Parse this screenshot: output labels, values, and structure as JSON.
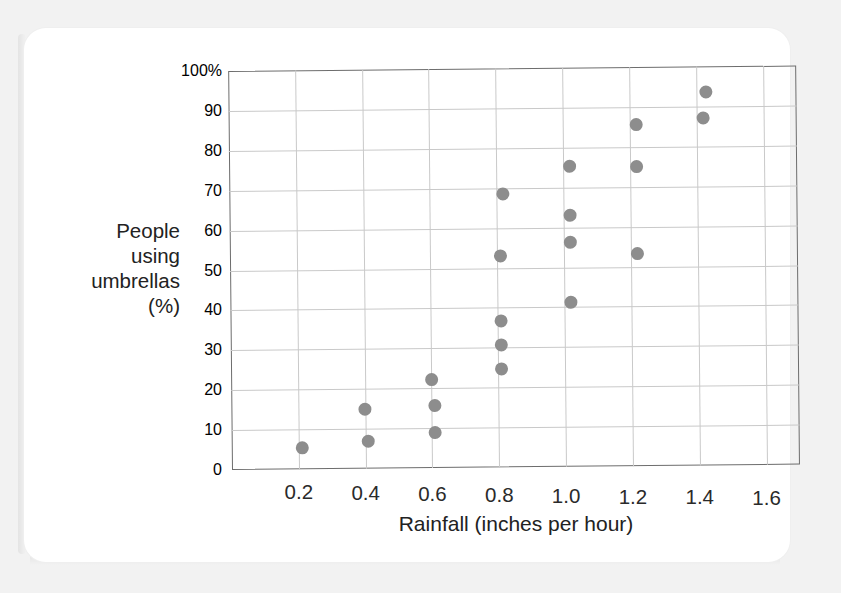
{
  "chart_data": {
    "type": "scatter",
    "title": "",
    "xlabel": "Rainfall (inches per hour)",
    "ylabel": "People using umbrellas (%)",
    "ylabel_lines": [
      "People",
      "using",
      "umbrellas",
      "(%)"
    ],
    "xlim": [
      0.0,
      1.7
    ],
    "ylim": [
      0,
      100
    ],
    "x_ticks": [
      0.2,
      0.4,
      0.6,
      0.8,
      1.0,
      1.2,
      1.4,
      1.6
    ],
    "x_tick_labels": [
      "0.2",
      "0.4",
      "0.6",
      "0.8",
      "1.0",
      "1.2",
      "1.4",
      "1.6"
    ],
    "y_ticks": [
      0,
      10,
      20,
      30,
      40,
      50,
      60,
      70,
      80,
      90,
      100
    ],
    "y_tick_labels": [
      "0",
      "10",
      "20",
      "30",
      "40",
      "50",
      "60",
      "70",
      "80",
      "90",
      "100%"
    ],
    "grid": true,
    "legend": false,
    "marker_color": "#8d8d8d",
    "grid_color": "#c9c9c9",
    "frame_color": "#6d6d6d",
    "points": [
      {
        "x": 0.21,
        "y": 5.5
      },
      {
        "x": 0.4,
        "y": 14.8
      },
      {
        "x": 0.41,
        "y": 6.8
      },
      {
        "x": 0.6,
        "y": 22.3
      },
      {
        "x": 0.61,
        "y": 15.6
      },
      {
        "x": 0.61,
        "y": 8.9
      },
      {
        "x": 0.82,
        "y": 68.5
      },
      {
        "x": 0.81,
        "y": 53.0
      },
      {
        "x": 0.81,
        "y": 36.7
      },
      {
        "x": 0.81,
        "y": 30.7
      },
      {
        "x": 0.81,
        "y": 24.7
      },
      {
        "x": 1.02,
        "y": 75.3
      },
      {
        "x": 1.02,
        "y": 63.0
      },
      {
        "x": 1.02,
        "y": 56.2
      },
      {
        "x": 1.02,
        "y": 41.2
      },
      {
        "x": 1.22,
        "y": 85.6
      },
      {
        "x": 1.22,
        "y": 75.0
      },
      {
        "x": 1.22,
        "y": 53.2
      },
      {
        "x": 1.43,
        "y": 93.6
      },
      {
        "x": 1.42,
        "y": 87.0
      }
    ]
  }
}
